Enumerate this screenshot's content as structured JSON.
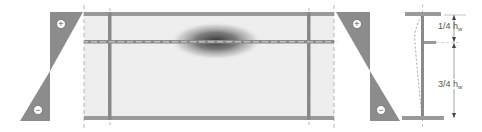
{
  "diagram": {
    "type": "plate-girder-web-buckling-with-longitudinal-stiffener",
    "colors": {
      "stress_fill": "#8c8c8c",
      "web_panel": "#eeeeee",
      "flange": "#9a9a9a",
      "stiffener": "#8a8a8a",
      "centerline": "#888888",
      "buckle_dark": "#333333",
      "symbol_bg": "#ffffff"
    },
    "left_stress_block": {
      "top_sign": "+",
      "bottom_sign": "−"
    },
    "right_stress_block": {
      "top_sign": "+",
      "bottom_sign": "−"
    },
    "panel": {
      "description": "Web panel between top and bottom flange with transverse stiffeners and a longitudinal stiffener; shaded ellipse shows local buckle above stiffener"
    },
    "cross_section": {
      "dim_upper": {
        "text": "1/4 h",
        "subscript": "w"
      },
      "dim_lower": {
        "text": "3/4 h",
        "subscript": "w"
      }
    }
  }
}
